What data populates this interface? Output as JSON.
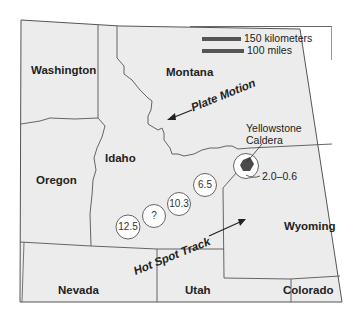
{
  "map": {
    "title": "Yellowstone hot spot track",
    "colors": {
      "land_fill": "#ececec",
      "border": "#555555",
      "caldera": "#4a4a4a",
      "circle_fill": "#ffffff",
      "text": "#222222",
      "scale_bar": "#555555"
    },
    "scale": {
      "km_label": "150 kilometers",
      "mi_label": "100 miles"
    },
    "states": [
      {
        "name": "Washington"
      },
      {
        "name": "Montana"
      },
      {
        "name": "Idaho"
      },
      {
        "name": "Oregon"
      },
      {
        "name": "Wyoming"
      },
      {
        "name": "Nevada"
      },
      {
        "name": "Utah"
      },
      {
        "name": "Colorado"
      }
    ],
    "annotations": {
      "plate_motion": "Plate Motion",
      "hot_spot_track": "Hot Spot Track",
      "caldera_line1": "Yellowstone",
      "caldera_line2": "Caldera",
      "caldera_age": "2.0–0.6"
    },
    "age_circles": [
      {
        "label": "12.5"
      },
      {
        "label": "?"
      },
      {
        "label": "10.3"
      },
      {
        "label": "6.5"
      }
    ],
    "age_units": "million years ago"
  }
}
